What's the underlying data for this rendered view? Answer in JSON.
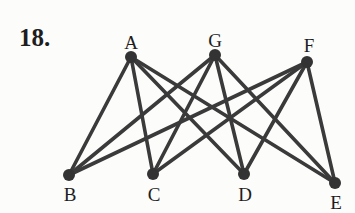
{
  "problem": {
    "number": "18."
  },
  "graph": {
    "type": "complete-bipartite",
    "edge_color": "#3a3a3a",
    "node_color": "#333333",
    "nodes": [
      {
        "id": "A",
        "label": "A",
        "x": 131,
        "y": 57,
        "label_x": 131,
        "label_y": 49
      },
      {
        "id": "G",
        "label": "G",
        "x": 215,
        "y": 55,
        "label_x": 215,
        "label_y": 47
      },
      {
        "id": "F",
        "label": "F",
        "x": 307,
        "y": 62,
        "label_x": 309,
        "label_y": 52
      },
      {
        "id": "B",
        "label": "B",
        "x": 69,
        "y": 175,
        "label_x": 70,
        "label_y": 201
      },
      {
        "id": "C",
        "label": "C",
        "x": 153,
        "y": 174,
        "label_x": 154,
        "label_y": 201
      },
      {
        "id": "D",
        "label": "D",
        "x": 244,
        "y": 174,
        "label_x": 245,
        "label_y": 201
      },
      {
        "id": "E",
        "label": "E",
        "x": 335,
        "y": 183,
        "label_x": 336,
        "label_y": 209
      }
    ],
    "edges": [
      [
        "A",
        "B"
      ],
      [
        "A",
        "C"
      ],
      [
        "A",
        "D"
      ],
      [
        "A",
        "E"
      ],
      [
        "G",
        "B"
      ],
      [
        "G",
        "C"
      ],
      [
        "G",
        "D"
      ],
      [
        "G",
        "E"
      ],
      [
        "F",
        "B"
      ],
      [
        "F",
        "C"
      ],
      [
        "F",
        "D"
      ],
      [
        "F",
        "E"
      ]
    ]
  }
}
